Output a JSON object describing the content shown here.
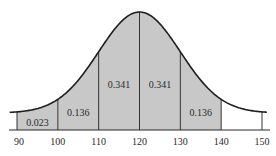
{
  "chart_data": {
    "type": "area",
    "title": "",
    "xlabel": "",
    "ylabel": "",
    "distribution": "normal",
    "mean": 120,
    "sd": 10,
    "x_ticks": [
      90,
      100,
      110,
      120,
      130,
      140,
      150
    ],
    "xlim": [
      88,
      152
    ],
    "grid": false,
    "shaded_regions": [
      {
        "from": 90,
        "to": 100,
        "probability": "0.023"
      },
      {
        "from": 100,
        "to": 110,
        "probability": "0.136"
      },
      {
        "from": 110,
        "to": 120,
        "probability": "0.341"
      },
      {
        "from": 120,
        "to": 130,
        "probability": "0.341"
      },
      {
        "from": 130,
        "to": 140,
        "probability": "0.136"
      }
    ],
    "unshaded_regions": [
      {
        "from": 140,
        "to": 150
      }
    ],
    "colors": {
      "fill": "#c8c8c8",
      "curve": "#1e1e1e",
      "axis": "#2a2a2a"
    }
  }
}
